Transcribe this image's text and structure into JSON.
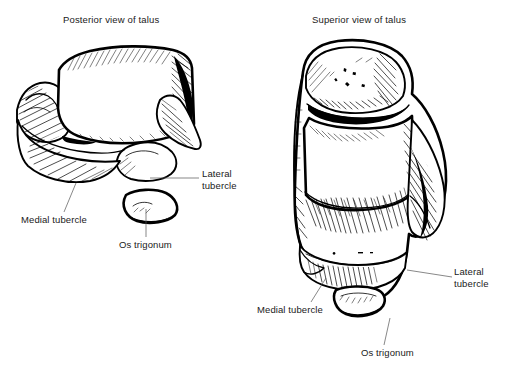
{
  "figure": {
    "background_color": "#ffffff",
    "ink_color": "#000000",
    "text_color": "#1a1a1a",
    "leader_color": "#555555",
    "style": "black-and-white pen-and-ink anatomical line drawing with crosshatch shading"
  },
  "panels": [
    {
      "id": "posterior",
      "title": "Posterior view of talus",
      "labels": [
        {
          "id": "lateral-tubercle",
          "text": "Lateral\ntubercle"
        },
        {
          "id": "medial-tubercle",
          "text": "Medial tubercle"
        },
        {
          "id": "os-trigonum",
          "text": "Os trigonum"
        }
      ]
    },
    {
      "id": "superior",
      "title": "Superior view of talus",
      "labels": [
        {
          "id": "lateral-tubercle",
          "text": "Lateral\ntubercle"
        },
        {
          "id": "medial-tubercle",
          "text": "Medial tubercle"
        },
        {
          "id": "os-trigonum",
          "text": "Os trigonum"
        }
      ]
    }
  ]
}
